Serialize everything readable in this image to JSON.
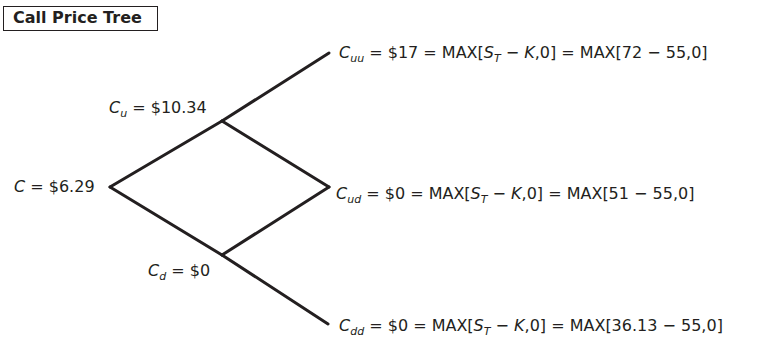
{
  "title": "Call Price Tree",
  "nodes": {
    "root": {
      "var": "C",
      "sub": "",
      "eq": " = ",
      "value": "$6.29"
    },
    "up": {
      "var": "C",
      "sub": "u",
      "eq": " = ",
      "value": "$10.34"
    },
    "down": {
      "var": "C",
      "sub": "d",
      "eq": " = ",
      "value": "$0"
    },
    "uu": {
      "var": "C",
      "sub": "uu",
      "value_text": " = $17 = MAX[",
      "st": "S",
      "st_sub": "T",
      "minus": " − ",
      "k": "K",
      "rest": ",0] = MAX[72 − 55,0]"
    },
    "ud": {
      "var": "C",
      "sub": "ud",
      "value_text": " = $0 = MAX[",
      "st": "S",
      "st_sub": "T",
      "minus": " − ",
      "k": "K",
      "rest": ",0] = MAX[51 − 55,0]"
    },
    "dd": {
      "var": "C",
      "sub": "dd",
      "value_text": " = $0 = MAX[",
      "st": "S",
      "st_sub": "T",
      "minus": " − ",
      "k": "K",
      "rest": ",0] = MAX[36.13 − 55,0]"
    }
  },
  "colors": {
    "line": "#231f20",
    "text": "#231f20"
  }
}
